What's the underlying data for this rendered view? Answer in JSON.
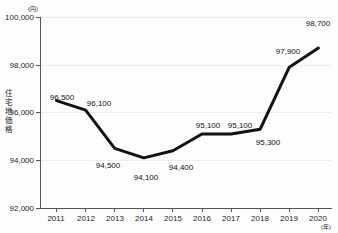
{
  "chart_data": {
    "type": "line",
    "title": "",
    "xlabel": "(年)",
    "ylabel": "住宅地価格",
    "yunit": "(円)",
    "categories": [
      "2011",
      "2012",
      "2013",
      "2014",
      "2015",
      "2016",
      "2017",
      "2018",
      "2019",
      "2020"
    ],
    "values": [
      96500,
      96100,
      94500,
      94100,
      94400,
      95100,
      95100,
      95300,
      97900,
      98700
    ],
    "point_labels": [
      "96,500",
      "96,100",
      "94,500",
      "94,100",
      "94,400",
      "95,100",
      "95,100",
      "95,300",
      "97,900",
      "98,700"
    ],
    "ylim": [
      92000,
      100000
    ],
    "yticks": [
      92000,
      94000,
      96000,
      98000,
      100000
    ],
    "ytick_labels": [
      "92,000",
      "94,000",
      "96,000",
      "98,000",
      "100,000"
    ],
    "grid": true,
    "legend": "none",
    "line_color": "#121212",
    "grid_color": "#ececec",
    "axis_color": "#555555"
  },
  "axis": {
    "y_title_chars": [
      "住",
      "宅",
      "地",
      "価",
      "格"
    ],
    "y_unit": "(円)",
    "x_unit": "(年)"
  }
}
